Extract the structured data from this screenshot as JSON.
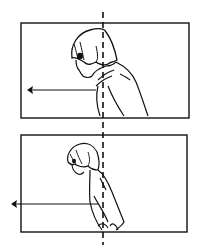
{
  "diagram": {
    "colors": {
      "ink": "#111111",
      "background": "#ffffff"
    },
    "reference_line": {
      "style": "dashed",
      "x": 103
    },
    "panels": [
      {
        "id": "top",
        "subject": "person with bob haircut, bust view, head forward of reference line",
        "arrow": {
          "direction": "left"
        }
      },
      {
        "id": "bottom",
        "subject": "person stooped over, full upper body, head forward of reference line",
        "arrow": {
          "direction": "left"
        }
      }
    ]
  }
}
